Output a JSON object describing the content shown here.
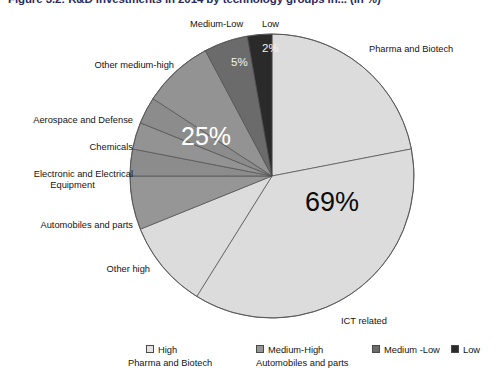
{
  "figure": {
    "title": "Figure 3.2:  R&D investments in 2014 by technology groups in... (in %)"
  },
  "chart_data": {
    "type": "pie",
    "title": "Figure 3.2:  R&D investments in 2014 by technology groups in... (in %)",
    "legend_position": "bottom",
    "grid": false,
    "groups": [
      {
        "name": "High",
        "value": 69,
        "label": "69%",
        "color": "#dcdcdc"
      },
      {
        "name": "Medium-High",
        "value": 25,
        "label": "25%",
        "color": "#8f8f8f"
      },
      {
        "name": "Medium -Low",
        "value": 5,
        "label": "5%",
        "color": "#6b6b6b"
      },
      {
        "name": "Low",
        "value": 2,
        "label": "2%",
        "color": "#2a2a2a"
      }
    ],
    "categories": [
      "Pharma and Biotech",
      "ICT related",
      "Other high",
      "Automobiles and parts",
      "Electronic and Electrical Equipment",
      "Chemicals",
      "Aerospace and Defense",
      "Other medium-high",
      "Medium-Low",
      "Low"
    ],
    "values": [
      22,
      37,
      10,
      9,
      3,
      3,
      3,
      7,
      5,
      2
    ],
    "slices": [
      {
        "label": "Pharma and Biotech",
        "value": 22,
        "group": "High",
        "color": "#dcdcdc",
        "start": 0,
        "end": 79
      },
      {
        "label": "ICT related",
        "value": 37,
        "group": "High",
        "color": "#dcdcdc",
        "start": 79,
        "end": 212
      },
      {
        "label": "Other high",
        "value": 10,
        "group": "High",
        "color": "#dcdcdc",
        "start": 212,
        "end": 248
      },
      {
        "label": "Automobiles and parts",
        "value": 9,
        "group": "Medium-High",
        "color": "#969696",
        "start": 248,
        "end": 270
      },
      {
        "label": "Electronic and Electrical Equipment",
        "value": 3,
        "group": "Medium-High",
        "color": "#8c8c8c",
        "start": 270,
        "end": 281
      },
      {
        "label": "Chemicals",
        "value": 3,
        "group": "Medium-High",
        "color": "#939393",
        "start": 281,
        "end": 292
      },
      {
        "label": "Aerospace and Defense",
        "value": 3,
        "group": "Medium-High",
        "color": "#8c8c8c",
        "start": 292,
        "end": 303
      },
      {
        "label": "Other medium-high",
        "value": 7,
        "group": "Medium-High",
        "color": "#939393",
        "start": 303,
        "end": 332
      },
      {
        "label": "Medium-Low",
        "value": 5,
        "group": "Medium -Low",
        "color": "#6b6b6b",
        "start": 332,
        "end": 350
      },
      {
        "label": "Low",
        "value": 2,
        "group": "Low",
        "color": "#2a2a2a",
        "start": 350,
        "end": 360
      }
    ],
    "callout_labels": [
      {
        "name": "pharma-and-biotech",
        "text": "Pharma and Biotech"
      },
      {
        "name": "ict-related",
        "text": "ICT related"
      },
      {
        "name": "other-high",
        "text": "Other high"
      },
      {
        "name": "automobiles-and-parts",
        "text": "Automobiles and parts"
      },
      {
        "name": "electronic-and-electrical-equipment",
        "text": "Electronic and Electrical"
      },
      {
        "name": "electronic-and-electrical-equipment-2",
        "text": "Equipment"
      },
      {
        "name": "chemicals",
        "text": "Chemicals"
      },
      {
        "name": "aerospace-and-defense",
        "text": "Aerospace and Defense"
      },
      {
        "name": "other-medium-high",
        "text": "Other medium-high"
      },
      {
        "name": "medium-low",
        "text": "Medium-Low"
      },
      {
        "name": "low",
        "text": "Low"
      }
    ],
    "data_labels": [
      {
        "name": "high",
        "text": "69%"
      },
      {
        "name": "medium-high",
        "text": "25%"
      },
      {
        "name": "medium-low",
        "text": "5%"
      },
      {
        "name": "low",
        "text": "2%"
      }
    ]
  },
  "labels": {
    "pharma_and_biotech": "Pharma and Biotech",
    "ict_related": "ICT related",
    "other_high": "Other high",
    "automobiles_and_parts": "Automobiles and parts",
    "electronic_line1": "Electronic and Electrical",
    "electronic_line2": "Equipment",
    "chemicals": "Chemicals",
    "aerospace_and_defense": "Aerospace and Defense",
    "other_medium_high": "Other medium-high",
    "medium_low": "Medium-Low",
    "low": "Low"
  },
  "percentages": {
    "high": "69%",
    "medium_high": "25%",
    "medium_low": "5%",
    "low": "2%"
  },
  "legend": {
    "items": [
      {
        "label": "High",
        "sub": "Pharma and Biotech",
        "color": "#e3e3e3"
      },
      {
        "label": "Medium-High",
        "sub": "Automobiles and parts",
        "color": "#969696"
      },
      {
        "label": "Medium -Low",
        "sub": "",
        "color": "#6b6b6b"
      },
      {
        "label": "Low",
        "sub": "",
        "color": "#2a2a2a"
      }
    ]
  }
}
